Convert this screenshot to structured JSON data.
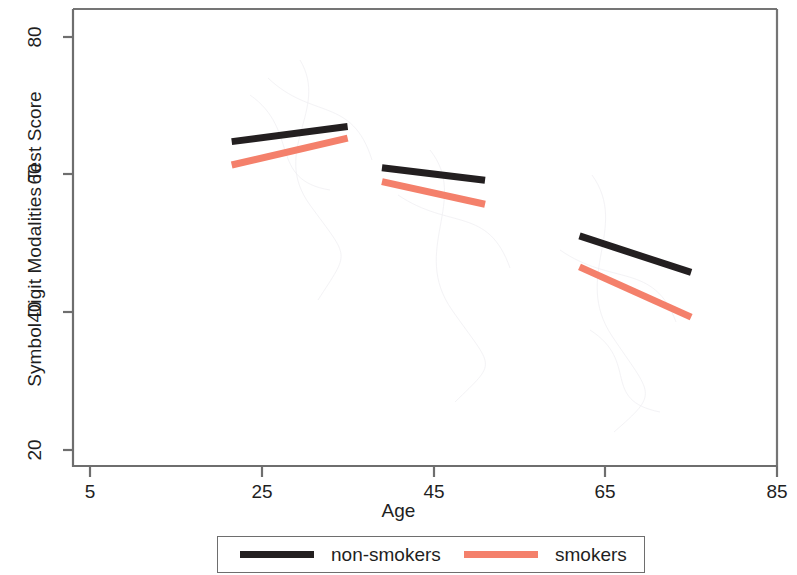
{
  "chart_data": {
    "type": "line",
    "title": "",
    "xlabel": "Age",
    "ylabel": "Symbol Digit Modalities Test Score",
    "xlim": [
      5,
      85
    ],
    "ylim": [
      14,
      87
    ],
    "xticks": [
      5,
      25,
      45,
      65,
      85
    ],
    "yticks": [
      20,
      40,
      60,
      80
    ],
    "grid": false,
    "legend_position": "bottom-outside",
    "colors": {
      "non_smokers": "#231f20",
      "smokers": "#f4806b",
      "axis": "#6e6e6e",
      "text": "#1f1f1f",
      "background": "#ffffff"
    },
    "series": [
      {
        "name": "non-smokers",
        "color": "#231f20",
        "segments": [
          {
            "group": "young",
            "x": [
              21.5,
              35.0
            ],
            "y": [
              64.8,
              67.0
            ]
          },
          {
            "group": "middle",
            "x": [
              39.0,
              51.0
            ],
            "y": [
              61.0,
              59.2
            ]
          },
          {
            "group": "older",
            "x": [
              62.0,
              75.0
            ],
            "y": [
              51.1,
              45.8
            ]
          }
        ]
      },
      {
        "name": "smokers",
        "color": "#f4806b",
        "segments": [
          {
            "group": "young",
            "x": [
              21.5,
              35.0
            ],
            "y": [
              61.4,
              65.3
            ]
          },
          {
            "group": "middle",
            "x": [
              39.0,
              51.0
            ],
            "y": [
              59.0,
              55.7
            ]
          },
          {
            "group": "older",
            "x": [
              62.0,
              75.0
            ],
            "y": [
              46.6,
              39.3
            ]
          }
        ]
      }
    ]
  },
  "axis": {
    "ylabel": "Symbol Digit Modalities Test Score",
    "xlabel": "Age",
    "yticks": [
      {
        "label": "80"
      },
      {
        "label": "60"
      },
      {
        "label": "40"
      },
      {
        "label": "20"
      }
    ],
    "xticks": [
      {
        "label": "5"
      },
      {
        "label": "25"
      },
      {
        "label": "45"
      },
      {
        "label": "65"
      },
      {
        "label": "85"
      }
    ]
  },
  "legend": {
    "entries": [
      {
        "label": "non-smokers",
        "color": "#231f20"
      },
      {
        "label": "smokers",
        "color": "#f4806b"
      }
    ]
  }
}
